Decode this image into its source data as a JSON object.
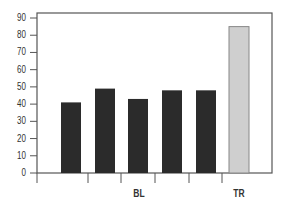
{
  "chart_data": {
    "type": "bar",
    "title": "",
    "xlabel": "",
    "ylabel": "",
    "ylim": [
      0,
      90
    ],
    "yticks": [
      0,
      10,
      20,
      30,
      40,
      50,
      60,
      70,
      80,
      90
    ],
    "grid": false,
    "legend": null,
    "categories": [
      "BL-1",
      "BL-2",
      "BL-3",
      "BL-4",
      "BL-5",
      "TR"
    ],
    "group_labels": [
      {
        "label": "BL",
        "bars": [
          0,
          1,
          2,
          3,
          4
        ]
      },
      {
        "label": "TR",
        "bars": [
          5
        ]
      }
    ],
    "values": [
      41,
      49,
      43,
      48,
      48,
      85
    ],
    "colors": [
      "#2b2b2b",
      "#2b2b2b",
      "#2b2b2b",
      "#2b2b2b",
      "#2b2b2b",
      "#cfcfcf"
    ]
  },
  "axis": {
    "x_group_labels": [
      "BL",
      "TR"
    ]
  },
  "colors": {
    "frame": "#555555",
    "dark_bar": "#2b2b2b",
    "light_bar": "#cfcfcf",
    "light_bar_border": "#888888"
  }
}
